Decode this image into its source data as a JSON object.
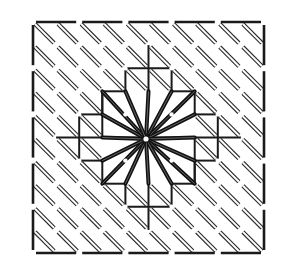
{
  "diagram": {
    "title": "",
    "canvas": {
      "grid_spacing_px": 7.7,
      "grid_extent": {
        "x0": 10,
        "y0": 5,
        "x1": 283,
        "y1": 273
      },
      "grid_color": "#8c8c8c"
    },
    "motif": {
      "origin": {
        "x": 33,
        "y": 22
      },
      "cell_px": 23.1,
      "cells": 10,
      "center": {
        "x": 146,
        "y": 139
      },
      "border_color": "#1a1a1a",
      "stitch_color": "#2a2a2a",
      "star_rays": 16,
      "star_color": "#111111"
    }
  }
}
